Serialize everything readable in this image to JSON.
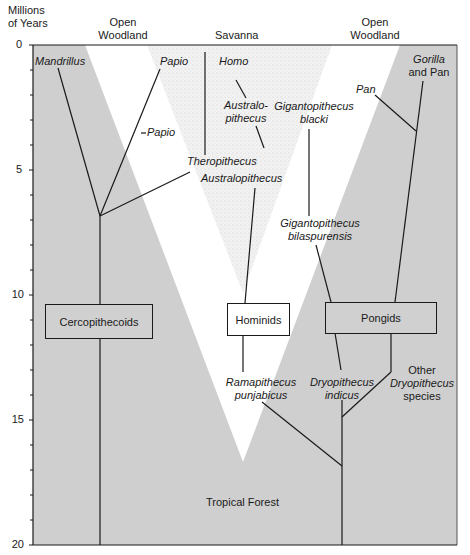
{
  "axis": {
    "title_line1": "Millions",
    "title_line2": "of Years",
    "ticks": [
      "0",
      "5",
      "10",
      "15",
      "20"
    ]
  },
  "habitats": {
    "left": {
      "line1": "Open",
      "line2": "Woodland"
    },
    "center": "Savanna",
    "right": {
      "line1": "Open",
      "line2": "Woodland"
    },
    "bottom": "Tropical Forest"
  },
  "groups": {
    "cercopithecoids": "Cercopithecoids",
    "hominids": "Hominids",
    "pongids": "Pongids"
  },
  "taxa": {
    "mandrillus": "Mandrillus",
    "papio_top": "Papio",
    "papio_mid": "Papio",
    "theropithecus": "Theropithecus",
    "homo": "Homo",
    "australopithecus_hyph1": "Australo-",
    "australopithecus_hyph2": "pithecus",
    "australopithecus": "Australopithecus",
    "giganto_blacki_1": "Gigantopithecus",
    "giganto_blacki_2": "blacki",
    "giganto_bilas_1": "Gigantopithecus",
    "giganto_bilas_2": "bilaspurensis",
    "pan": "Pan",
    "gorilla_pan_1": "Gorilla",
    "gorilla_pan_2": "and Pan",
    "ramapithecus_1": "Ramapithecus",
    "ramapithecus_2": "punjabicus",
    "dryo_indicus_1": "Dryopithecus",
    "dryo_indicus_2": "indicus",
    "other_dryo_1": "Other",
    "other_dryo_2": "Dryopithecus",
    "other_dryo_3": "species"
  },
  "colors": {
    "forest_gray": "#cfcfcf",
    "savanna_stipple": "#eeeeee",
    "line": "#1a1a1a"
  }
}
